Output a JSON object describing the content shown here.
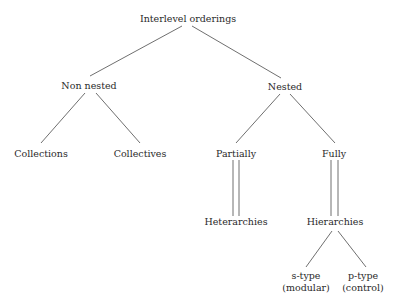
{
  "diagram": {
    "type": "tree",
    "background": "#ffffff",
    "text_color": "#2a2a2a",
    "line_color": "#4a4a4a",
    "nodes": {
      "root": {
        "label": "Interlevel orderings"
      },
      "non_nested": {
        "label": "Non nested"
      },
      "nested": {
        "label": "Nested"
      },
      "collections": {
        "label": "Collections"
      },
      "collectives": {
        "label": "Collectives"
      },
      "partially": {
        "label": "Partially"
      },
      "fully": {
        "label": "Fully"
      },
      "heterarchies": {
        "label": "Heterarchies"
      },
      "hierarchies": {
        "label": "Hierarchies"
      },
      "s_type": {
        "label_line1": "s-type",
        "label_line2": "(modular)"
      },
      "p_type": {
        "label_line1": "p-type",
        "label_line2": "(control)"
      }
    },
    "edges": [
      {
        "from": "Interlevel orderings",
        "to": "Non nested",
        "style": "single"
      },
      {
        "from": "Interlevel orderings",
        "to": "Nested",
        "style": "single"
      },
      {
        "from": "Non nested",
        "to": "Collections",
        "style": "single"
      },
      {
        "from": "Non nested",
        "to": "Collectives",
        "style": "single"
      },
      {
        "from": "Nested",
        "to": "Partially",
        "style": "single"
      },
      {
        "from": "Nested",
        "to": "Fully",
        "style": "single"
      },
      {
        "from": "Partially",
        "to": "Heterarchies",
        "style": "double"
      },
      {
        "from": "Fully",
        "to": "Hierarchies",
        "style": "double"
      },
      {
        "from": "Hierarchies",
        "to": "s-type (modular)",
        "style": "single"
      },
      {
        "from": "Hierarchies",
        "to": "p-type (control)",
        "style": "single"
      }
    ]
  }
}
